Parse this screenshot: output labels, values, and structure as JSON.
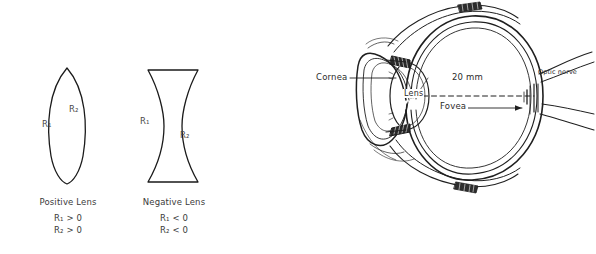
{
  "figures": {
    "positive_lens": {
      "name": "Positive Lens",
      "caption_title": "Positive Lens",
      "condition_1": "R₁ > 0",
      "condition_2": "R₂ > 0",
      "radius_label_1": "R₁",
      "radius_label_2": "R₂",
      "shape": "biconvex"
    },
    "negative_lens": {
      "name": "Negative Lens",
      "caption_title": "Negative Lens",
      "condition_1": "R₁ < 0",
      "condition_2": "R₂ < 0",
      "radius_label_1": "R₁",
      "radius_label_2": "R₂",
      "shape": "biconcave"
    }
  },
  "eye_diagram": {
    "title": "Cross section of the human eye",
    "labels": {
      "cornea": "Cornea",
      "lens": "Lens",
      "dimension": "20 mm",
      "fovea": "Fovea",
      "optic_nerve": "Optic nerve"
    }
  },
  "colors": {
    "ink": "#2b2b2b",
    "outline": "#1a1a1a",
    "text": "#3b3b3b",
    "background": "#ffffff"
  }
}
